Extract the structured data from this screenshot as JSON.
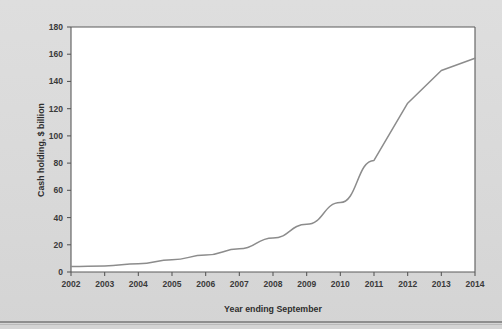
{
  "chart_data": {
    "type": "line",
    "title": "",
    "xlabel": "Year ending September",
    "ylabel": "Cash holding, $ billion",
    "x": [
      2002,
      2003,
      2004,
      2005,
      2006,
      2007,
      2008,
      2009,
      2010,
      2011,
      2012,
      2013,
      2014
    ],
    "values": [
      4,
      4.5,
      6,
      9,
      12.5,
      17,
      25,
      35,
      51,
      82,
      124,
      148,
      157
    ],
    "series": [
      {
        "name": "Cash holding",
        "values": [
          4,
          4.5,
          6,
          9,
          12.5,
          17,
          25,
          35,
          51,
          82,
          124,
          148,
          157
        ],
        "color": "#8c8c8c"
      }
    ],
    "xlim": [
      2002,
      2014
    ],
    "ylim": [
      0,
      180
    ],
    "yticks": [
      0,
      20,
      40,
      60,
      80,
      100,
      120,
      140,
      160,
      180
    ],
    "ytick_labels": [
      "0",
      "20",
      "40",
      "60",
      "80",
      "100",
      "120",
      "140",
      "160",
      "180"
    ],
    "xticks": [
      2002,
      2003,
      2004,
      2005,
      2006,
      2007,
      2008,
      2009,
      2010,
      2011,
      2012,
      2013,
      2014
    ],
    "xtick_labels": [
      "2002",
      "2003",
      "2004",
      "2005",
      "2006",
      "2007",
      "2008",
      "2009",
      "2010",
      "2011",
      "2012",
      "2013",
      "2014"
    ],
    "grid": false,
    "legend": false,
    "legend_position": "none",
    "plot_background": "#ffffff",
    "page_background": "#dcdcdc",
    "axis_color": "#5a5a5a"
  }
}
